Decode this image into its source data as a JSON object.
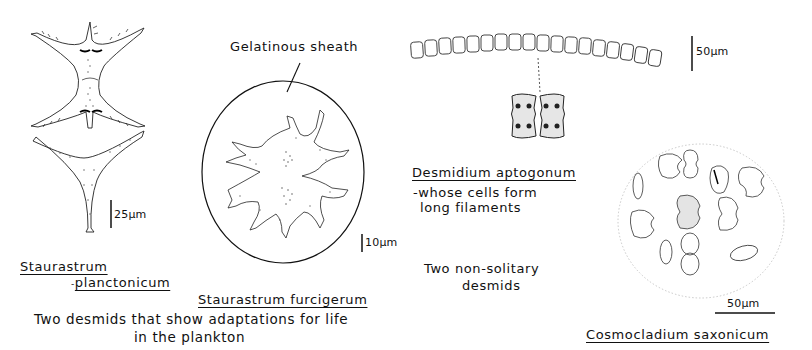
{
  "figure": {
    "panels": [
      {
        "id": "staurastrum-planctonicum",
        "species_line1": "Staurastrum",
        "species_line2": "planctonicum",
        "species_line2_prefix": "-",
        "scale_bar": "25µm"
      },
      {
        "id": "staurastrum-furcigerum",
        "annotation": "Gelatinous sheath",
        "species": "Staurastrum furcigerum",
        "scale_bar": "10µm"
      },
      {
        "id": "desmidium-aptogonum",
        "species": "Desmidium aptogonum",
        "description_line1": "-whose cells form",
        "description_line2": "long filaments",
        "scale_bar": "50µm"
      },
      {
        "id": "cosmocladium-saxonicum",
        "species": "Cosmocladium saxonicum",
        "scale_bar": "50µm"
      }
    ],
    "group_captions": {
      "plankton_line1": "Two desmids that show adaptations for life",
      "plankton_line2": "in the plankton",
      "non_solitary_line1": "Two non-solitary",
      "non_solitary_line2": "desmids"
    },
    "colors": {
      "ink": "#111111",
      "stipple": "#555555",
      "background": "#ffffff"
    }
  }
}
